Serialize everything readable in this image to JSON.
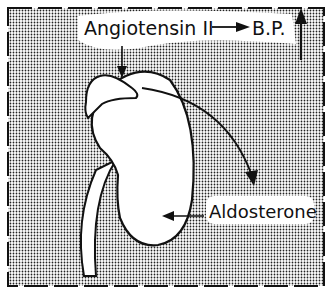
{
  "diagram": {
    "labels": {
      "angiotensin": "Angiotensin II",
      "bp": "B.P.",
      "aldosterone": "Aldosterone"
    },
    "arrows": [
      {
        "from": "angiotensin",
        "to": "adrenal-gland",
        "direction": "down"
      },
      {
        "from": "angiotensin",
        "to": "bp",
        "direction": "right"
      },
      {
        "from": "bp",
        "meaning": "increase",
        "direction": "up"
      },
      {
        "from": "adrenal-gland",
        "to": "aldosterone",
        "direction": "curved-down"
      },
      {
        "from": "aldosterone",
        "to": "kidney",
        "direction": "left"
      }
    ],
    "colors": {
      "background": "#ffffff",
      "stipple": "#222222",
      "line": "#111111",
      "organ_fill": "#ffffff"
    }
  }
}
